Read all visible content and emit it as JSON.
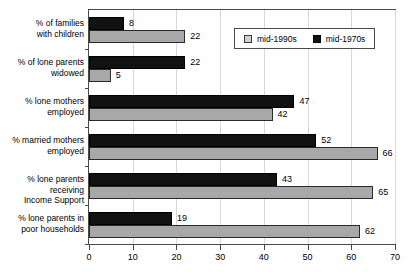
{
  "chart_data": {
    "type": "bar",
    "orientation": "horizontal",
    "title": "",
    "subtitle": "",
    "xlabel": "",
    "ylabel": "",
    "xlim": [
      0,
      70
    ],
    "xticks": [
      0,
      10,
      20,
      30,
      40,
      50,
      60,
      70
    ],
    "xtick_labels": [
      "0",
      "10",
      "20",
      "30",
      "40",
      "50",
      "60",
      "70"
    ],
    "grid": true,
    "grid_axis": "x",
    "legend_position": "top-right",
    "categories": [
      "% of families with children",
      "% of lone parents widowed",
      "% lone mothers employed",
      "% married mothers employed",
      "% lone parents receiving Income Support",
      "% lone parents in poor households"
    ],
    "category_lines": [
      [
        "% of families",
        "with children"
      ],
      [
        "% of lone parents",
        "widowed"
      ],
      [
        "% lone mothers",
        "employed"
      ],
      [
        "% married mothers",
        "employed"
      ],
      [
        "% lone parents receiving",
        "Income Support"
      ],
      [
        "% lone parents in",
        "poor households"
      ]
    ],
    "series": [
      {
        "name": "mid-1970s",
        "color": "#121212",
        "values": [
          8,
          22,
          47,
          52,
          43,
          19
        ]
      },
      {
        "name": "mid-1990s",
        "color": "#a8a8a8",
        "values": [
          22,
          5,
          42,
          66,
          65,
          62
        ]
      }
    ]
  },
  "legend": {
    "entries": [
      {
        "label": "mid-1990s",
        "swatch": "gray-swatch-icon"
      },
      {
        "label": "mid-1970s",
        "swatch": "black-swatch-icon"
      }
    ]
  }
}
